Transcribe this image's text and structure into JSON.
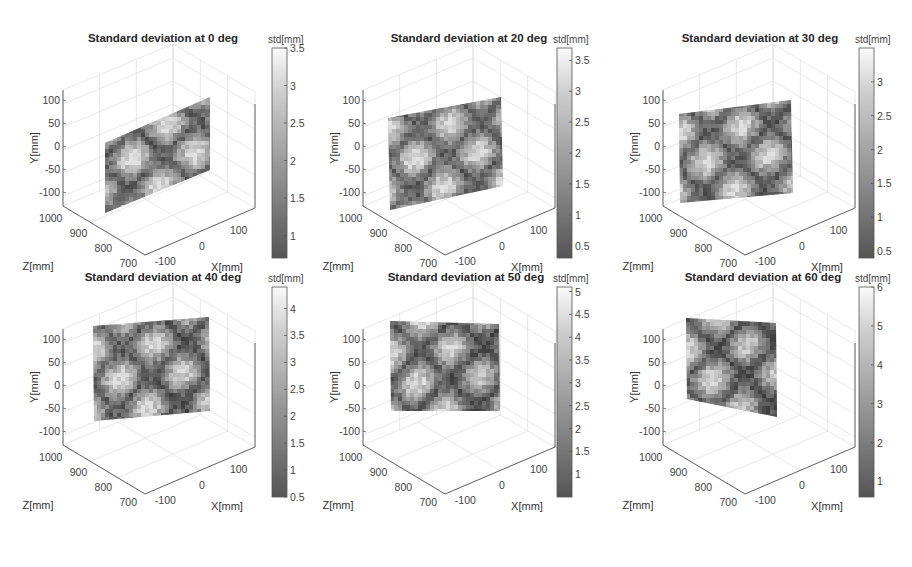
{
  "chart_data": [
    {
      "type": "heatmap",
      "subtype": "3d-surface",
      "title": "Standard deviation at 0 deg",
      "xlabel": "X[mm]",
      "ylabel": "Y[mm]",
      "zlabel": "Z[mm]",
      "xticks": [
        -100,
        0,
        100
      ],
      "yticks": [
        100,
        50,
        0,
        -50,
        -100
      ],
      "zticks": [
        1000,
        900,
        800,
        700
      ],
      "colorbar": {
        "label": "std[mm]",
        "ticks": [
          3.5,
          3,
          2.5,
          2,
          1.5,
          1
        ],
        "range": [
          0.7,
          3.5
        ]
      },
      "grid": true
    },
    {
      "type": "heatmap",
      "subtype": "3d-surface",
      "title": "Standard deviation at 20 deg",
      "xlabel": "X[mm]",
      "ylabel": "Y[mm]",
      "zlabel": "Z[mm]",
      "xticks": [
        -100,
        0,
        100
      ],
      "yticks": [
        100,
        50,
        0,
        -50,
        -100
      ],
      "zticks": [
        1000,
        900,
        800,
        700
      ],
      "colorbar": {
        "label": "std[mm]",
        "ticks": [
          3.5,
          3,
          2.5,
          2,
          1.5,
          1,
          0.5
        ],
        "range": [
          0.3,
          3.7
        ]
      },
      "grid": true
    },
    {
      "type": "heatmap",
      "subtype": "3d-surface",
      "title": "Standard deviation at 30 deg",
      "xlabel": "X[mm]",
      "ylabel": "Y[mm]",
      "zlabel": "Z[mm]",
      "xticks": [
        -100,
        0,
        100
      ],
      "yticks": [
        100,
        50,
        0,
        -50,
        -100
      ],
      "zticks": [
        1000,
        900,
        800,
        700
      ],
      "colorbar": {
        "label": "std[mm]",
        "ticks": [
          3,
          2.5,
          2,
          1.5,
          1,
          0.5
        ],
        "range": [
          0.4,
          3.5
        ]
      },
      "grid": true
    },
    {
      "type": "heatmap",
      "subtype": "3d-surface",
      "title": "Standard deviation at 40 deg",
      "xlabel": "X[mm]",
      "ylabel": "Y[mm]",
      "zlabel": "Z[mm]",
      "xticks": [
        -100,
        0,
        100
      ],
      "yticks": [
        100,
        50,
        0,
        -50,
        -100
      ],
      "zticks": [
        1000,
        900,
        800,
        700
      ],
      "colorbar": {
        "label": "std[mm]",
        "ticks": [
          4,
          3.5,
          3,
          2.5,
          2,
          1.5,
          1,
          0.5
        ],
        "range": [
          0.5,
          4.4
        ]
      },
      "grid": true
    },
    {
      "type": "heatmap",
      "subtype": "3d-surface",
      "title": "Standard deviation at 50 deg",
      "xlabel": "X[mm]",
      "ylabel": "Y[mm]",
      "zlabel": "Z[mm]",
      "xticks": [
        -100,
        0,
        100
      ],
      "yticks": [
        100,
        50,
        0,
        -50,
        -100
      ],
      "zticks": [
        1000,
        900,
        800,
        700
      ],
      "colorbar": {
        "label": "std[mm]",
        "ticks": [
          5,
          4.5,
          4,
          3.5,
          3,
          2.5,
          2,
          1.5,
          1
        ],
        "range": [
          0.5,
          5.1
        ]
      },
      "grid": true
    },
    {
      "type": "heatmap",
      "subtype": "3d-surface",
      "title": "Standard deviation at 60 deg",
      "xlabel": "X[mm]",
      "ylabel": "Y[mm]",
      "zlabel": "Z[mm]",
      "xticks": [
        -100,
        0,
        100
      ],
      "yticks": [
        100,
        50,
        0,
        -50,
        -100
      ],
      "zticks": [
        1000,
        900,
        800,
        700
      ],
      "colorbar": {
        "label": "std[mm]",
        "ticks": [
          6,
          5,
          4,
          3,
          2,
          1
        ],
        "range": [
          0.6,
          6
        ]
      },
      "grid": true
    }
  ],
  "panels": [
    {
      "title": "Standard deviation at 0 deg",
      "cb_label": "std[mm]",
      "cb_ticks": [
        "3.5",
        "3",
        "2.5",
        "2",
        "1.5",
        "1"
      ]
    },
    {
      "title": "Standard deviation at 20 deg",
      "cb_label": "std[mm]",
      "cb_ticks": [
        "3.5",
        "3",
        "2.5",
        "2",
        "1.5",
        "1",
        "0.5"
      ]
    },
    {
      "title": "Standard deviation at 30 deg",
      "cb_label": "std[mm]",
      "cb_ticks": [
        "3",
        "2.5",
        "2",
        "1.5",
        "1",
        "0.5"
      ]
    },
    {
      "title": "Standard deviation at 40 deg",
      "cb_label": "std[mm]",
      "cb_ticks": [
        "4",
        "3.5",
        "3",
        "2.5",
        "2",
        "1.5",
        "1",
        "0.5"
      ]
    },
    {
      "title": "Standard deviation at 50 deg",
      "cb_label": "std[mm]",
      "cb_ticks": [
        "5",
        "4.5",
        "4",
        "3.5",
        "3",
        "2.5",
        "2",
        "1.5",
        "1"
      ]
    },
    {
      "title": "Standard deviation at 60 deg",
      "cb_label": "std[mm]",
      "cb_ticks": [
        "6",
        "5",
        "4",
        "3",
        "2",
        "1"
      ]
    }
  ],
  "axes": {
    "xlabel": "X[mm]",
    "ylabel": "Y[mm]",
    "zlabel": "Z[mm]",
    "yticks": [
      "100",
      "50",
      "0",
      "-50",
      "-100"
    ],
    "zticks": [
      "1000",
      "900",
      "800",
      "700"
    ],
    "xticks": [
      "-100",
      "0",
      "100"
    ]
  }
}
